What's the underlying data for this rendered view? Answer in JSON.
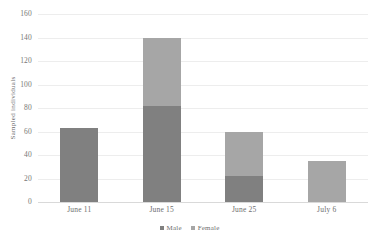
{
  "chart_data": {
    "type": "bar",
    "stacked": true,
    "title": "",
    "xlabel": "",
    "ylabel": "Sampled individuals",
    "categories": [
      "June 11",
      "June 15",
      "June 25",
      "July 6"
    ],
    "series": [
      {
        "name": "Male",
        "color": "#808080",
        "values": [
          63,
          82,
          22,
          0
        ]
      },
      {
        "name": "Female",
        "color": "#a6a6a6",
        "values": [
          0,
          58,
          38,
          35
        ]
      }
    ],
    "totals": [
      63,
      140,
      60,
      35
    ],
    "ylim": [
      0,
      160
    ],
    "ytick_step": 20,
    "yticks": [
      "160",
      "140",
      "120",
      "100",
      "80",
      "60",
      "40",
      "20",
      "0"
    ],
    "grid": "horizontal",
    "legend_position": "bottom-center",
    "legend": [
      "Male",
      "Female"
    ]
  }
}
